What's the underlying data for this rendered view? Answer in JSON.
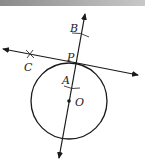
{
  "diagram": {
    "type": "geometry-construction",
    "colors": {
      "stroke": "#1a1a1a",
      "banner": "#a0a0a0",
      "background": "#ffffff"
    },
    "points": {
      "B": {
        "label": "B",
        "x": 72,
        "y": 31
      },
      "P": {
        "label": "P",
        "x": 68,
        "y": 60
      },
      "C": {
        "label": "C",
        "x": 24,
        "y": 70
      },
      "A": {
        "label": "A",
        "x": 62,
        "y": 82
      },
      "O": {
        "label": "O",
        "x": 75,
        "y": 105
      }
    },
    "circle": {
      "center": "O",
      "cx": 69,
      "cy": 101,
      "r": 38
    },
    "lines": [
      {
        "name": "line-OP",
        "x1": 59,
        "y1": 158,
        "x2": 85,
        "y2": 14
      },
      {
        "name": "tangent-line",
        "x1": 3,
        "y1": 49,
        "x2": 138,
        "y2": 75
      }
    ]
  }
}
